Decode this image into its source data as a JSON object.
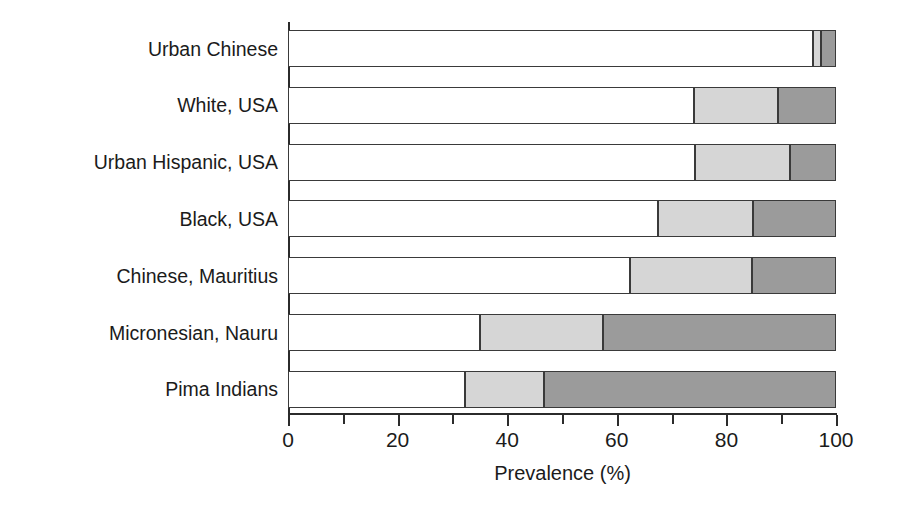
{
  "chart_data": {
    "type": "bar",
    "orientation": "horizontal",
    "stacked": true,
    "title": "",
    "xlabel": "Prevalence (%)",
    "ylabel": "",
    "xlim": [
      0,
      100
    ],
    "xticks": [
      0,
      10,
      20,
      30,
      40,
      50,
      60,
      70,
      80,
      90,
      100
    ],
    "xtick_labels": [
      "0",
      "",
      "20",
      "",
      "40",
      "",
      "60",
      "",
      "80",
      "",
      "100"
    ],
    "grid": false,
    "legend": "none",
    "categories": [
      "Urban Chinese",
      "White, USA",
      "Urban Hispanic, USA",
      "Black, USA",
      "Chinese, Mauritius",
      "Micronesian, Nauru",
      "Pima Indians"
    ],
    "series": [
      {
        "name": "Normal glucose tolerance",
        "color": "#ffffff",
        "values": [
          95.8,
          74.0,
          74.2,
          67.5,
          62.4,
          35.0,
          32.3
        ]
      },
      {
        "name": "Impaired glucose tolerance",
        "color": "#d6d6d6",
        "values": [
          1.5,
          15.4,
          17.4,
          17.4,
          22.3,
          22.5,
          14.4
        ]
      },
      {
        "name": "Diabetes",
        "color": "#9b9b9b",
        "values": [
          2.7,
          10.6,
          8.4,
          15.1,
          15.3,
          42.5,
          53.3
        ]
      }
    ]
  },
  "colors": {
    "axis": "#2b2b2b",
    "text": "#1b1b1b",
    "segment_light": "#ffffff",
    "segment_mid": "#d6d6d6",
    "segment_dark": "#9b9b9b",
    "segment_border": "#3a3a3a",
    "background": "#ffffff"
  }
}
